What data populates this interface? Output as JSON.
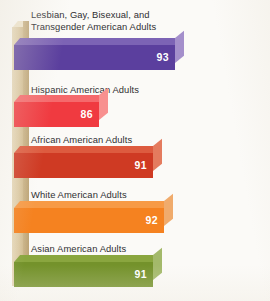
{
  "chart_data": {
    "type": "bar",
    "orientation": "horizontal",
    "title": "",
    "subtitle": "",
    "xlabel": "",
    "ylabel": "",
    "grid": false,
    "legend": false,
    "xlim": [
      0,
      100
    ],
    "categories": [
      "Lesbian, Gay, Bisexual, and\nTransgender American Adults",
      "Hispanic American Adults",
      "African American Adults",
      "White American Adults",
      "Asian American Adults"
    ],
    "values": [
      93,
      86,
      91,
      92,
      91
    ],
    "value_labels": [
      "93",
      "86",
      "91",
      "92",
      "91"
    ],
    "series": [
      {
        "name": "",
        "values": [
          93,
          86,
          91,
          92,
          91
        ]
      }
    ],
    "bars": [
      {
        "label": "Lesbian, Gay, Bisexual, and\nTransgender American Adults",
        "value": 93,
        "value_label": "93",
        "color_front": "#5b3f9e",
        "color_top": "#7c63b5",
        "color_cap": "#a48fcb"
      },
      {
        "label": "Hispanic American Adults",
        "value": 86,
        "value_label": "86",
        "color_front": "#f03a40",
        "color_top": "#f5696c",
        "color_cap": "#f8908f"
      },
      {
        "label": "African American Adults",
        "value": 91,
        "value_label": "91",
        "color_front": "#cf3a23",
        "color_top": "#dd5b3f",
        "color_cap": "#e47b5e"
      },
      {
        "label": "White American Adults",
        "value": 92,
        "value_label": "92",
        "color_front": "#f58220",
        "color_top": "#f79a46",
        "color_cap": "#f0ab6c"
      },
      {
        "label": "Asian American Adults",
        "value": 91,
        "value_label": "91",
        "color_front": "#74922b",
        "color_top": "#8aa63f",
        "color_cap": "#a3b96a"
      }
    ]
  },
  "axis": {
    "name": "vertical-axis-spine",
    "color_front": "#ddcba6",
    "color_side": "#bda476",
    "color_top": "#efe5cd"
  },
  "page": {
    "background": "#fbfaf7"
  }
}
